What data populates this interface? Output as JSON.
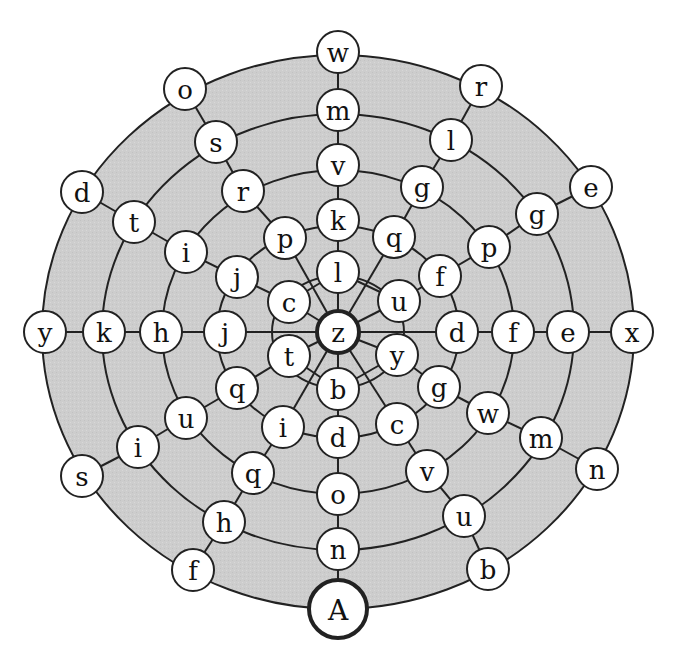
{
  "diagram": {
    "type": "letter-maze",
    "colors": {
      "background": "#ffffff",
      "ring_fill": "#cfcfcf",
      "ring_fill_inner": "#d6d6d6",
      "stroke": "#222222",
      "node_fill": "#ffffff",
      "text": "#111111"
    },
    "center": {
      "x": 338,
      "y": 332
    },
    "rings": [
      {
        "rx": 296,
        "ry": 277
      },
      {
        "rx": 236,
        "ry": 218
      },
      {
        "rx": 176,
        "ry": 162
      },
      {
        "rx": 121,
        "ry": 106
      },
      {
        "rx": 66,
        "ry": 56
      }
    ],
    "node_radius": 21,
    "nodes": [
      {
        "id": "z",
        "label": "z",
        "x": 338,
        "y": 332,
        "bold": true,
        "ring": 0
      },
      {
        "id": "c0_l",
        "label": "l",
        "x": 338,
        "y": 272,
        "ring": 0
      },
      {
        "id": "c0_u",
        "label": "u",
        "x": 399,
        "y": 301,
        "ring": 0
      },
      {
        "id": "c0_y",
        "label": "y",
        "x": 397,
        "y": 355,
        "ring": 0
      },
      {
        "id": "c0_b",
        "label": "b",
        "x": 338,
        "y": 389,
        "ring": 0
      },
      {
        "id": "c0_t",
        "label": "t",
        "x": 289,
        "y": 356,
        "ring": 0
      },
      {
        "id": "c0_c",
        "label": "c",
        "x": 289,
        "y": 302,
        "ring": 0
      },
      {
        "id": "r1_k",
        "label": "k",
        "x": 338,
        "y": 220,
        "ring": 1
      },
      {
        "id": "r1_q",
        "label": "q",
        "x": 394,
        "y": 237,
        "ring": 1
      },
      {
        "id": "r1_f",
        "label": "f",
        "x": 440,
        "y": 276,
        "ring": 1
      },
      {
        "id": "r1_d",
        "label": "d",
        "x": 457,
        "y": 332,
        "ring": 1
      },
      {
        "id": "r1_g",
        "label": "g",
        "x": 439,
        "y": 387,
        "ring": 1
      },
      {
        "id": "r1_c",
        "label": "c",
        "x": 397,
        "y": 424,
        "ring": 1
      },
      {
        "id": "r1_d2",
        "label": "d",
        "x": 338,
        "y": 437,
        "ring": 1
      },
      {
        "id": "r1_i",
        "label": "i",
        "x": 283,
        "y": 427,
        "ring": 1
      },
      {
        "id": "r1_q2",
        "label": "q",
        "x": 237,
        "y": 388,
        "ring": 1
      },
      {
        "id": "r1_j",
        "label": "j",
        "x": 225,
        "y": 332,
        "ring": 1
      },
      {
        "id": "r1_j2",
        "label": "j",
        "x": 237,
        "y": 277,
        "ring": 1
      },
      {
        "id": "r1_p",
        "label": "p",
        "x": 285,
        "y": 238,
        "ring": 1
      },
      {
        "id": "r2_v",
        "label": "v",
        "x": 338,
        "y": 165,
        "ring": 2
      },
      {
        "id": "r2_g",
        "label": "g",
        "x": 422,
        "y": 187,
        "ring": 2
      },
      {
        "id": "r2_p",
        "label": "p",
        "x": 489,
        "y": 247,
        "ring": 2
      },
      {
        "id": "r2_f",
        "label": "f",
        "x": 513,
        "y": 332,
        "ring": 2
      },
      {
        "id": "r2_w",
        "label": "w",
        "x": 488,
        "y": 413,
        "ring": 2
      },
      {
        "id": "r2_v2",
        "label": "v",
        "x": 427,
        "y": 471,
        "ring": 2
      },
      {
        "id": "r2_o",
        "label": "o",
        "x": 338,
        "y": 494,
        "ring": 2
      },
      {
        "id": "r2_q",
        "label": "q",
        "x": 253,
        "y": 473,
        "ring": 2
      },
      {
        "id": "r2_u",
        "label": "u",
        "x": 186,
        "y": 418,
        "ring": 2
      },
      {
        "id": "r2_h",
        "label": "h",
        "x": 161,
        "y": 332,
        "ring": 2
      },
      {
        "id": "r2_i",
        "label": "i",
        "x": 186,
        "y": 252,
        "ring": 2
      },
      {
        "id": "r2_r",
        "label": "r",
        "x": 243,
        "y": 191,
        "ring": 2
      },
      {
        "id": "r3_m",
        "label": "m",
        "x": 338,
        "y": 110,
        "ring": 3
      },
      {
        "id": "r3_l",
        "label": "l",
        "x": 451,
        "y": 140,
        "ring": 3
      },
      {
        "id": "r3_g",
        "label": "g",
        "x": 537,
        "y": 214,
        "ring": 3
      },
      {
        "id": "r3_e",
        "label": "e",
        "x": 568,
        "y": 332,
        "ring": 3
      },
      {
        "id": "r3_m2",
        "label": "m",
        "x": 541,
        "y": 438,
        "ring": 3
      },
      {
        "id": "r3_u",
        "label": "u",
        "x": 464,
        "y": 516,
        "ring": 3
      },
      {
        "id": "r3_n",
        "label": "n",
        "x": 338,
        "y": 549,
        "ring": 3
      },
      {
        "id": "r3_h",
        "label": "h",
        "x": 224,
        "y": 522,
        "ring": 3
      },
      {
        "id": "r3_i",
        "label": "i",
        "x": 138,
        "y": 447,
        "ring": 3
      },
      {
        "id": "r3_k",
        "label": "k",
        "x": 104,
        "y": 332,
        "ring": 3
      },
      {
        "id": "r3_t",
        "label": "t",
        "x": 134,
        "y": 222,
        "ring": 3
      },
      {
        "id": "r3_s",
        "label": "s",
        "x": 216,
        "y": 142,
        "ring": 3
      },
      {
        "id": "r4_w",
        "label": "w",
        "x": 338,
        "y": 52,
        "ring": 4
      },
      {
        "id": "r4_r",
        "label": "r",
        "x": 481,
        "y": 86,
        "ring": 4
      },
      {
        "id": "r4_e",
        "label": "e",
        "x": 591,
        "y": 187,
        "ring": 4
      },
      {
        "id": "r4_x",
        "label": "x",
        "x": 632,
        "y": 332,
        "ring": 4
      },
      {
        "id": "r4_n",
        "label": "n",
        "x": 597,
        "y": 469,
        "ring": 4
      },
      {
        "id": "r4_b",
        "label": "b",
        "x": 488,
        "y": 569,
        "ring": 4
      },
      {
        "id": "A",
        "label": "A",
        "x": 338,
        "y": 609,
        "bold": true,
        "cap": true,
        "ring": 4
      },
      {
        "id": "r4_f",
        "label": "f",
        "x": 193,
        "y": 570,
        "ring": 4
      },
      {
        "id": "r4_s",
        "label": "s",
        "x": 82,
        "y": 476,
        "ring": 4
      },
      {
        "id": "r4_y",
        "label": "y",
        "x": 45,
        "y": 332,
        "ring": 4
      },
      {
        "id": "r4_d",
        "label": "d",
        "x": 82,
        "y": 192,
        "ring": 4
      },
      {
        "id": "r4_o",
        "label": "o",
        "x": 185,
        "y": 89,
        "ring": 4
      }
    ],
    "spokes": [
      [
        "r4_w",
        "r3_m"
      ],
      [
        "r3_m",
        "r2_v"
      ],
      [
        "r2_v",
        "r1_k"
      ],
      [
        "r1_k",
        "c0_l"
      ],
      [
        "c0_l",
        "z"
      ],
      [
        "z",
        "c0_b"
      ],
      [
        "c0_b",
        "r1_d2"
      ],
      [
        "r1_d2",
        "r2_o"
      ],
      [
        "r2_o",
        "r3_n"
      ],
      [
        "r3_n",
        "A"
      ],
      [
        "r4_y",
        "r3_k"
      ],
      [
        "r3_k",
        "r2_h"
      ],
      [
        "r2_h",
        "r1_j"
      ],
      [
        "r1_j",
        "z"
      ],
      [
        "z",
        "r1_d"
      ],
      [
        "r1_d",
        "r2_f"
      ],
      [
        "r2_f",
        "r3_e"
      ],
      [
        "r3_e",
        "r4_x"
      ],
      [
        "r4_o",
        "r3_s"
      ],
      [
        "r3_s",
        "r2_r"
      ],
      [
        "r2_r",
        "r1_p"
      ],
      [
        "r1_p",
        "z"
      ],
      [
        "r4_r",
        "r3_l"
      ],
      [
        "r3_l",
        "r2_g"
      ],
      [
        "r2_g",
        "r1_q"
      ],
      [
        "r1_q",
        "z"
      ],
      [
        "r4_d",
        "r3_t"
      ],
      [
        "r3_t",
        "r2_i"
      ],
      [
        "r2_i",
        "r1_j2"
      ],
      [
        "r1_j2",
        "c0_c"
      ],
      [
        "r4_e",
        "r3_g"
      ],
      [
        "r3_g",
        "r2_p"
      ],
      [
        "r2_p",
        "r1_f"
      ],
      [
        "r1_f",
        "c0_u"
      ],
      [
        "r4_s",
        "r3_i"
      ],
      [
        "r3_i",
        "r2_u"
      ],
      [
        "r2_u",
        "r1_q2"
      ],
      [
        "r1_q2",
        "c0_t"
      ],
      [
        "r4_n",
        "r3_m2"
      ],
      [
        "r3_m2",
        "r2_w"
      ],
      [
        "r2_w",
        "r1_g"
      ],
      [
        "r1_g",
        "c0_y"
      ],
      [
        "r4_f",
        "r3_h"
      ],
      [
        "r3_h",
        "r2_q"
      ],
      [
        "r2_q",
        "r1_i"
      ],
      [
        "r1_i",
        "z"
      ],
      [
        "r4_b",
        "r3_u"
      ],
      [
        "r3_u",
        "r2_v2"
      ],
      [
        "r2_v2",
        "r1_c"
      ],
      [
        "r1_c",
        "z"
      ],
      [
        "c0_c",
        "z"
      ],
      [
        "c0_u",
        "z"
      ],
      [
        "c0_t",
        "z"
      ],
      [
        "c0_y",
        "z"
      ],
      [
        "c0_c",
        "c0_l"
      ],
      [
        "c0_l",
        "c0_u"
      ],
      [
        "c0_t",
        "c0_b"
      ],
      [
        "c0_b",
        "c0_y"
      ]
    ]
  }
}
